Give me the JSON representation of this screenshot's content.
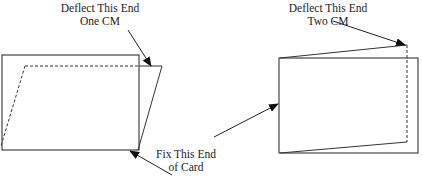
{
  "diagram": {
    "type": "card-deflection-illustration",
    "labels": {
      "left_deflect": {
        "line1": "Deflect This End",
        "line2": "One CM"
      },
      "right_deflect": {
        "line1": "Deflect This End",
        "line2": "Two CM"
      },
      "fix": {
        "line1": "Fix This End",
        "line2": "of Card"
      }
    },
    "colors": {
      "stroke": "#222222",
      "background": "#ffffff"
    },
    "figures": [
      {
        "name": "left-card",
        "deflection": "One CM",
        "style": "shear-parallelogram"
      },
      {
        "name": "right-card",
        "deflection": "Two CM",
        "style": "skew-top-bottom"
      }
    ]
  }
}
